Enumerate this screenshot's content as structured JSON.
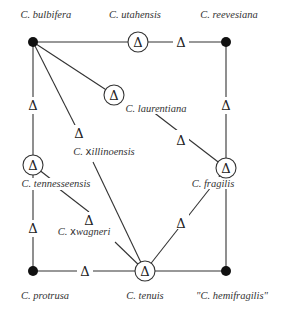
{
  "diagram": {
    "type": "species-relationship-diagram",
    "delta_symbol": "Δ",
    "diploid_species": [
      {
        "id": "bulbifera",
        "label": "C. bulbifera"
      },
      {
        "id": "reevesiana",
        "label": "C. reevesiana"
      },
      {
        "id": "protrusa",
        "label": "C. protrusa"
      },
      {
        "id": "hemifragilis",
        "label": "\"C. hemifragilis\""
      }
    ],
    "allopolyploids": [
      {
        "id": "utahensis",
        "label": "C. utahensis"
      },
      {
        "id": "laurentiana",
        "label": "C. laurentiana"
      },
      {
        "id": "tennesseensis",
        "label": "C. tennesseensis"
      },
      {
        "id": "fragilis",
        "label": "C. fragilis"
      },
      {
        "id": "tenuis",
        "label": "C. tenuis"
      }
    ],
    "sterile_hybrids": [
      {
        "id": "xillinoensis",
        "label_prefix": "C. ",
        "label_x": "x",
        "label_rest": "illinoensis"
      },
      {
        "id": "xwagneri",
        "label_prefix": "C. ",
        "label_x": "x",
        "label_rest": "wagneri"
      }
    ],
    "labels": {
      "bulbifera": "C. bulbifera",
      "utahensis": "C. utahensis",
      "reevesiana": "C. reevesiana",
      "laurentiana": "C. laurentiana",
      "xillinoensis_prefix": "C. ",
      "xillinoensis_x": "x",
      "xillinoensis_rest": "illinoensis",
      "tennesseensis": "C. tennesseensis",
      "fragilis": "C. fragilis",
      "xwagneri_prefix": "C. ",
      "xwagneri_x": "x",
      "xwagneri_rest": "wagneri",
      "protrusa": "C. protrusa",
      "tenuis": "C. tenuis",
      "hemifragilis": "\"C. hemifragilis\""
    },
    "colors": {
      "line": "#333333",
      "node": "#111111",
      "text": "#333333"
    }
  }
}
